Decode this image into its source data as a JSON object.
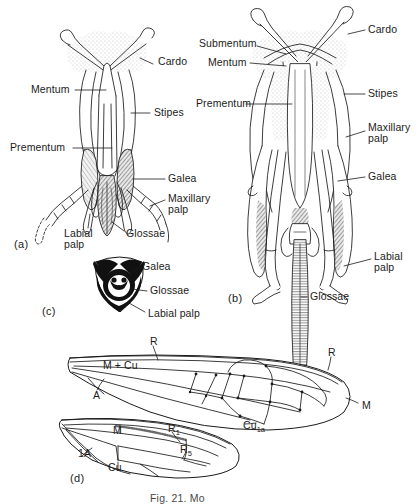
{
  "figure": {
    "caption": "Fig. 21. Mo",
    "panels": [
      {
        "id": "a",
        "label": "(a)",
        "x": 14,
        "y": 238
      },
      {
        "id": "b",
        "label": "(b)",
        "x": 228,
        "y": 292
      },
      {
        "id": "c",
        "label": "(c)",
        "x": 42,
        "y": 305
      },
      {
        "id": "d",
        "label": "(d)",
        "x": 70,
        "y": 472
      }
    ]
  },
  "panel_a": {
    "title": "honeybee mouthparts ventral view",
    "labels": [
      {
        "name": "cardo",
        "text": "Cardo",
        "x": 158,
        "y": 61,
        "align": "left"
      },
      {
        "name": "mentum",
        "text": "Mentum",
        "x": 31,
        "y": 87,
        "align": "left"
      },
      {
        "name": "stipes",
        "text": "Stipes",
        "x": 154,
        "y": 110,
        "align": "left"
      },
      {
        "name": "prementum",
        "text": "Prementum",
        "x": 10,
        "y": 144,
        "align": "left"
      },
      {
        "name": "galea",
        "text": "Galea",
        "x": 168,
        "y": 176,
        "align": "left"
      },
      {
        "name": "maxillary-palp",
        "text": "Maxillary\npalp",
        "x": 168,
        "y": 196,
        "align": "left"
      },
      {
        "name": "labial-palp",
        "text": "Labial\npalp",
        "x": 64,
        "y": 231,
        "align": "left"
      },
      {
        "name": "glossae",
        "text": "Glossae",
        "x": 126,
        "y": 231,
        "align": "left"
      }
    ]
  },
  "panel_b": {
    "title": "honeybee mouthparts dorsal view",
    "labels": [
      {
        "name": "submentum",
        "text": "Submentum",
        "x": 199,
        "y": 41,
        "align": "left"
      },
      {
        "name": "cardo",
        "text": "Cardo",
        "x": 368,
        "y": 27,
        "align": "left"
      },
      {
        "name": "mentum",
        "text": "Mentum",
        "x": 208,
        "y": 60,
        "align": "left"
      },
      {
        "name": "stipes",
        "text": "Stipes",
        "x": 368,
        "y": 91,
        "align": "left"
      },
      {
        "name": "prementum",
        "text": "Prementum",
        "x": 196,
        "y": 100,
        "align": "left"
      },
      {
        "name": "maxillary-palp",
        "text": "Maxillary\npalp",
        "x": 368,
        "y": 125,
        "align": "left"
      },
      {
        "name": "galea",
        "text": "Galea",
        "x": 368,
        "y": 174,
        "align": "left"
      },
      {
        "name": "labial-palp",
        "text": "Labial\npalp",
        "x": 374,
        "y": 254,
        "align": "left"
      },
      {
        "name": "glossae",
        "text": "Glossae",
        "x": 310,
        "y": 294,
        "align": "left"
      }
    ]
  },
  "panel_c": {
    "title": "cross-section of proboscis",
    "labels": [
      {
        "name": "galea",
        "text": "Galea",
        "x": 142,
        "y": 264,
        "align": "left"
      },
      {
        "name": "glossae",
        "text": "Glossae",
        "x": 150,
        "y": 288,
        "align": "left"
      },
      {
        "name": "labial-palp",
        "text": "Labial palp",
        "x": 148,
        "y": 311,
        "align": "left"
      }
    ]
  },
  "panel_d": {
    "title": "fore and hind wing venation",
    "forewing_labels": [
      {
        "name": "vein-r-fore",
        "text": "R",
        "x": 150,
        "y": 340,
        "align": "left"
      },
      {
        "name": "vein-r-apex",
        "text": "R",
        "x": 328,
        "y": 351,
        "align": "left"
      },
      {
        "name": "vein-m-plus-cu",
        "text": "M + Cu",
        "x": 103,
        "y": 364,
        "align": "left"
      },
      {
        "name": "vein-a",
        "text": "A",
        "x": 93,
        "y": 394,
        "align": "left"
      },
      {
        "name": "vein-m-fore",
        "text": "M",
        "x": 362,
        "y": 404,
        "align": "left"
      },
      {
        "name": "vein-cu1a",
        "text": "Cu",
        "sub": "1a",
        "x": 243,
        "y": 424,
        "align": "left"
      }
    ],
    "hindwing_labels": [
      {
        "name": "vein-m-hind",
        "text": "M",
        "x": 113,
        "y": 429,
        "align": "left"
      },
      {
        "name": "vein-r1",
        "text": "R",
        "sub": "1",
        "x": 168,
        "y": 427,
        "align": "left"
      },
      {
        "name": "vein-r5",
        "text": "R",
        "sub": "5",
        "x": 180,
        "y": 448,
        "align": "left"
      },
      {
        "name": "vein-1a",
        "text": "1A",
        "x": 78,
        "y": 452,
        "align": "left"
      },
      {
        "name": "vein-cu-hind",
        "text": "Cu",
        "x": 108,
        "y": 466,
        "align": "left"
      }
    ]
  },
  "colors": {
    "ink": "#1a1a1a",
    "background": "#ffffff",
    "stipple": "#c9c9c9",
    "hatch_dark": "#6f6f6f",
    "solid_black": "#111111"
  }
}
